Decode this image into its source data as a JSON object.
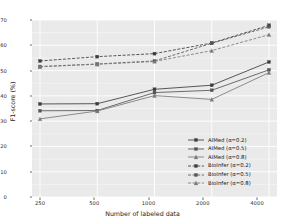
{
  "chart_data": {
    "type": "line",
    "title": "",
    "xlabel": "Number of labeled data",
    "ylabel": "F1-score (%)",
    "categories": [
      "250",
      "500",
      "1000",
      "2000",
      "4000"
    ],
    "ylim": [
      0,
      70
    ],
    "yticks": [
      0,
      10,
      20,
      30,
      40,
      50,
      60,
      70
    ],
    "grid": true,
    "legend_position": "lower right",
    "series": [
      {
        "name": "AIMed (α=0.2)",
        "values": [
          36.8,
          36.9,
          42.6,
          44.2,
          53.4
        ],
        "style": "solid",
        "color": "#3c3c3c",
        "marker": "square"
      },
      {
        "name": "AIMed (α=0.5)",
        "values": [
          34.1,
          34.2,
          41.3,
          42.2,
          50.3
        ],
        "style": "solid",
        "color": "#555555",
        "marker": "square"
      },
      {
        "name": "AIMed (α=0.8)",
        "values": [
          30.9,
          34.0,
          40.1,
          38.6,
          49.2
        ],
        "style": "solid",
        "color": "#7a7a7a",
        "marker": "triangle"
      },
      {
        "name": "BioInfer (α=0.2)",
        "values": [
          53.8,
          55.5,
          56.7,
          60.9,
          67.9
        ],
        "style": "dashed",
        "color": "#3c3c3c",
        "marker": "square"
      },
      {
        "name": "BioInfer (α=0.5)",
        "values": [
          51.6,
          52.6,
          53.8,
          60.8,
          67.3
        ],
        "style": "dashed",
        "color": "#555555",
        "marker": "square"
      },
      {
        "name": "BioInfer (α=0.8)",
        "values": [
          51.5,
          52.5,
          53.6,
          57.9,
          64.2
        ],
        "style": "dashed",
        "color": "#7a7a7a",
        "marker": "triangle"
      }
    ]
  },
  "axis": {
    "ytick_labels": [
      "70",
      "60",
      "50",
      "40",
      "30",
      "20",
      "10",
      "0"
    ],
    "xtick_labels": [
      "250",
      "500",
      "1000",
      "2000",
      "4000"
    ],
    "xlabel": "Number of labeled data",
    "ylabel": "F1-score (%)"
  },
  "legend": {
    "items": [
      {
        "label": "AIMed (α=0.2)"
      },
      {
        "label": "AIMed (α=0.5)"
      },
      {
        "label": "AIMed (α=0.8)"
      },
      {
        "label": "BioInfer (α=0.2)"
      },
      {
        "label": "BioInfer (α=0.5)"
      },
      {
        "label": "BioInfer (α=0.8)"
      }
    ]
  }
}
